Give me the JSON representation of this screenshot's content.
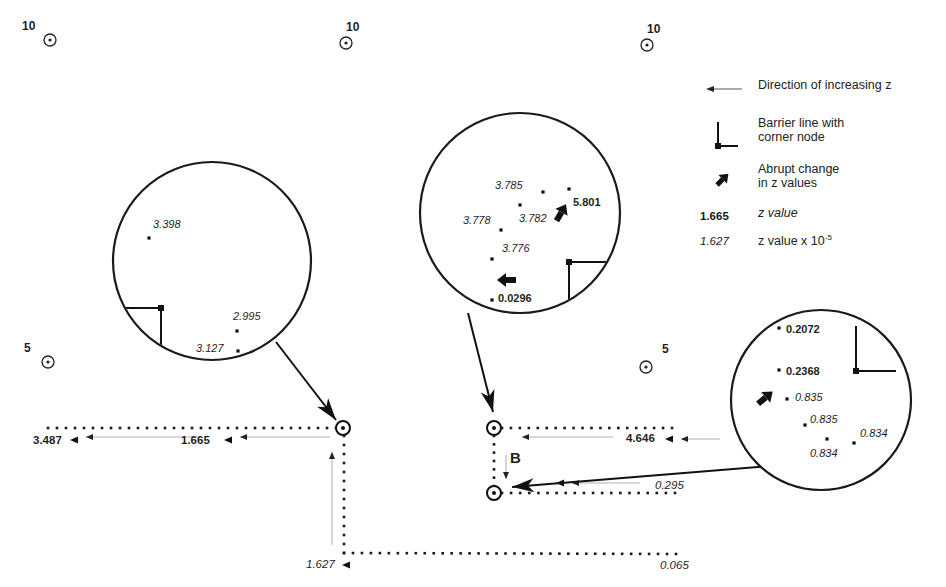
{
  "figure": {
    "grid_markers": [
      {
        "label": "10",
        "x": 50,
        "y": 40,
        "label_dx": -28,
        "label_dy": -6
      },
      {
        "label": "10",
        "x": 346,
        "y": 43,
        "label_dx": 0,
        "label_dy": -8
      },
      {
        "label": "10",
        "x": 647,
        "y": 45,
        "label_dx": 0,
        "label_dy": -8
      },
      {
        "label": "5",
        "x": 48,
        "y": 362,
        "label_dx": -24,
        "label_dy": -6
      },
      {
        "label": "5",
        "x": 646,
        "y": 367,
        "label_dx": 16,
        "label_dy": -10
      }
    ],
    "nodes": [
      {
        "id": "corner-node-left",
        "x": 343,
        "y": 428
      },
      {
        "id": "node-b-top",
        "x": 494,
        "y": 428
      },
      {
        "id": "node-b-bottom",
        "x": 494,
        "y": 493
      }
    ],
    "paths": {
      "left_horizontal": {
        "from": [
          48,
          428
        ],
        "to": [
          336,
          428
        ]
      },
      "left_vertical": {
        "from": [
          344,
          436
        ],
        "to": [
          344,
          553
        ]
      },
      "bottom_horizontal": {
        "from": [
          344,
          553
        ],
        "to": [
          676,
          554
        ]
      },
      "b_top_horizontal": {
        "from": [
          502,
          428
        ],
        "to": [
          672,
          428
        ]
      },
      "b_connector": {
        "from": [
          494,
          436
        ],
        "to": [
          494,
          486
        ]
      },
      "b_bottom_horizontal": {
        "from": [
          502,
          493
        ],
        "to": [
          675,
          493
        ]
      }
    },
    "path_values": [
      {
        "text": "3.487",
        "style": "bold",
        "x": 33,
        "y": 444,
        "arrow_x": 74,
        "arrow_y": 440
      },
      {
        "text": "1.665",
        "style": "bold",
        "x": 181,
        "y": 444,
        "arrow_x": 228,
        "arrow_y": 440
      },
      {
        "text": "4.646",
        "style": "bold",
        "x": 626,
        "y": 442,
        "arrow_x": 669,
        "arrow_y": 439
      },
      {
        "text": "0.295",
        "style": "italic",
        "x": 655,
        "y": 489,
        "arrow_x": 560,
        "arrow_y": 483
      },
      {
        "text": "1.627",
        "style": "italic",
        "x": 306,
        "y": 568,
        "arrow_x": 346,
        "arrow_y": 565
      },
      {
        "text": "0.065",
        "style": "italic",
        "x": 660,
        "y": 569,
        "arrow_x": null,
        "arrow_y": null
      }
    ],
    "direction_arrows": [
      {
        "x1": 200,
        "y1": 437,
        "x2": 86,
        "y2": 437
      },
      {
        "x1": 330,
        "y1": 437,
        "x2": 240,
        "y2": 437
      },
      {
        "x1": 613,
        "y1": 437,
        "x2": 522,
        "y2": 437
      },
      {
        "x1": 720,
        "y1": 439,
        "x2": 681,
        "y2": 439
      },
      {
        "x1": 640,
        "y1": 483,
        "x2": 572,
        "y2": 483
      },
      {
        "x1": 332,
        "y1": 545,
        "x2": 332,
        "y2": 452
      },
      {
        "x1": 506,
        "y1": 455,
        "x2": 506,
        "y2": 479
      }
    ],
    "segment_label": {
      "text": "B",
      "x": 510,
      "y": 463
    },
    "callouts": [
      {
        "id": "magnifier-left",
        "cx": 212,
        "cy": 261,
        "r": 99,
        "barrier": {
          "corner": [
            161,
            308
          ],
          "h_end": 122,
          "v_end": 354
        },
        "leader": {
          "from": [
            276,
            342
          ],
          "to": [
            336,
            420
          ]
        },
        "points": [
          {
            "x": 149,
            "y": 238,
            "label": "3.398",
            "style": "italic",
            "lx": 153,
            "ly": 228
          },
          {
            "x": 237,
            "y": 331,
            "label": "2.995",
            "style": "italic",
            "lx": 233,
            "ly": 320
          },
          {
            "x": 238,
            "y": 351,
            "label": "3.127",
            "style": "italic",
            "lx": 196,
            "ly": 352
          }
        ],
        "abrupt_arrows": []
      },
      {
        "id": "magnifier-middle",
        "cx": 520,
        "cy": 213,
        "r": 100,
        "barrier": {
          "corner": [
            569,
            262
          ],
          "h_end": 609,
          "v_end": 306
        },
        "leader": {
          "from": [
            468,
            313
          ],
          "to": [
            493,
            412
          ]
        },
        "points": [
          {
            "x": 543,
            "y": 192,
            "label": "3.785",
            "style": "italic",
            "lx": 495,
            "ly": 189
          },
          {
            "x": 569,
            "y": 189,
            "label": "5.801",
            "style": "bold",
            "lx": 573,
            "ly": 206
          },
          {
            "x": 520,
            "y": 205,
            "label": "3.782",
            "style": "italic",
            "lx": 519,
            "ly": 222
          },
          {
            "x": 501,
            "y": 230,
            "label": "3.778",
            "style": "italic",
            "lx": 463,
            "ly": 224
          },
          {
            "x": 492,
            "y": 259,
            "label": "3.776",
            "style": "italic",
            "lx": 502,
            "ly": 252
          },
          {
            "x": 492,
            "y": 300,
            "label": "0.0296",
            "style": "bold",
            "lx": 498,
            "ly": 302
          }
        ],
        "abrupt_arrows": [
          {
            "x": 561,
            "y": 213,
            "angle": -60,
            "label": "up-arrow"
          },
          {
            "x": 507,
            "y": 280,
            "angle": 180,
            "label": "left-arrow"
          }
        ]
      },
      {
        "id": "magnifier-right",
        "cx": 821,
        "cy": 400,
        "r": 90,
        "barrier": {
          "corner": [
            856,
            371
          ],
          "h_end": 896,
          "v_end": 326
        },
        "leader": {
          "from": [
            880,
            457
          ],
          "to": [
            512,
            487
          ]
        },
        "points": [
          {
            "x": 779,
            "y": 328,
            "label": "0.2072",
            "style": "bold",
            "lx": 786,
            "ly": 333
          },
          {
            "x": 779,
            "y": 370,
            "label": "0.2368",
            "style": "bold",
            "lx": 786,
            "ly": 375
          },
          {
            "x": 787,
            "y": 399,
            "label": "0.835",
            "style": "italic",
            "lx": 795,
            "ly": 401
          },
          {
            "x": 805,
            "y": 425,
            "label": "0.835",
            "style": "italic",
            "lx": 810,
            "ly": 423
          },
          {
            "x": 827,
            "y": 439,
            "label": "0.834",
            "style": "italic",
            "lx": 810,
            "ly": 457
          },
          {
            "x": 854,
            "y": 443,
            "label": "0.834",
            "style": "italic",
            "lx": 860,
            "ly": 437
          }
        ],
        "abrupt_arrows": [
          {
            "x": 765,
            "y": 398,
            "angle": -40,
            "label": "up-right-arrow"
          }
        ]
      }
    ]
  },
  "legend": {
    "items": [
      {
        "symbol": "arrow-left",
        "label": "Direction of increasing z"
      },
      {
        "symbol": "barrier-corner",
        "label_line1": "Barrier line with",
        "label_line2": "corner node"
      },
      {
        "symbol": "abrupt-arrow",
        "label_line1": "Abrupt change",
        "label_line2": "in z values"
      },
      {
        "symbol": "bold-value",
        "value": "1.665",
        "label": "z value"
      },
      {
        "symbol": "italic-value",
        "value": "1.627",
        "label": "z value x 10",
        "superscript": "-5"
      }
    ]
  },
  "colors": {
    "ink": "#1a1a1a",
    "faint": "#9a9a9a",
    "background": "#ffffff"
  }
}
